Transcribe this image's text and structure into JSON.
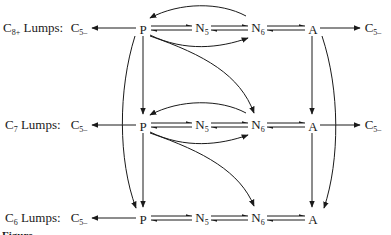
{
  "diagram": {
    "type": "reaction-network",
    "rows": [
      {
        "label_main": "C",
        "label_sub": "8+",
        "label_rest": " Lumps:",
        "y": 28,
        "left_product": {
          "main": "C",
          "sub": "5–"
        },
        "nodes": [
          {
            "main": "P",
            "sub": ""
          },
          {
            "main": "N",
            "sub": "5"
          },
          {
            "main": "N",
            "sub": "6"
          },
          {
            "main": "A",
            "sub": ""
          }
        ],
        "right_product": {
          "main": "C",
          "sub": "5–"
        }
      },
      {
        "label_main": "C",
        "label_sub": "7",
        "label_rest": " Lumps:",
        "y": 125,
        "left_product": {
          "main": "C",
          "sub": "5–"
        },
        "nodes": [
          {
            "main": "P",
            "sub": ""
          },
          {
            "main": "N",
            "sub": "5"
          },
          {
            "main": "N",
            "sub": "6"
          },
          {
            "main": "A",
            "sub": ""
          }
        ],
        "right_product": {
          "main": "C",
          "sub": "5–"
        }
      },
      {
        "label_main": "C",
        "label_sub": "6",
        "label_rest": " Lumps:",
        "y": 218,
        "left_product": {
          "main": "C",
          "sub": "5–"
        },
        "nodes": [
          {
            "main": "P",
            "sub": ""
          },
          {
            "main": "N",
            "sub": "5"
          },
          {
            "main": "N",
            "sub": "6"
          },
          {
            "main": "A",
            "sub": ""
          }
        ]
      }
    ],
    "columns_x": {
      "label": 3,
      "c5_left": 76,
      "P": 143,
      "N5": 202,
      "N6": 258,
      "A": 313,
      "c5_right": 370
    },
    "edges": [
      "P → C5- (each row)",
      "P ⇌ N5",
      "N5 ⇌ N6",
      "N6 ⇌ A",
      "A → C5- (rows 1,2)",
      "N6 → P (curved, rows 1,2)",
      "P → N6 (curved, rows 1,2)",
      "P(row) → N6(next row) (curved)",
      "P → P next row (vertical)",
      "A → A next row (vertical)",
      "P(row1) → P(row3) (long curve)",
      "A(row1) → A(row3) (long curve)"
    ],
    "colors": {
      "line": "#1a1a1a",
      "background": "#ffffff"
    }
  },
  "caption": {
    "text": "Figure"
  }
}
